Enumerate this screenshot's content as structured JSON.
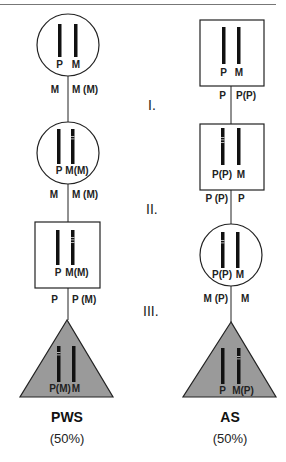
{
  "generations": [
    {
      "roman": "I."
    },
    {
      "roman": "II."
    },
    {
      "roman": "III."
    }
  ],
  "left_pedigree": {
    "individuals": [
      {
        "shape": "circle",
        "chromosome_labels": [
          "P",
          "M"
        ],
        "transmission_labels": [
          "M",
          "M (M)"
        ]
      },
      {
        "shape": "circle",
        "chromosome_labels": [
          "P",
          "M(M)"
        ],
        "transmission_labels": [
          "M",
          "M (M)"
        ]
      },
      {
        "shape": "square",
        "chromosome_labels": [
          "P",
          "M(M)"
        ],
        "transmission_labels": [
          "P",
          "P (M)"
        ]
      },
      {
        "shape": "triangle",
        "affected": true,
        "chromosome_labels": [
          "P(M)",
          "M"
        ]
      }
    ],
    "syndrome": "PWS",
    "risk": "(50%)"
  },
  "right_pedigree": {
    "individuals": [
      {
        "shape": "square",
        "chromosome_labels": [
          "P",
          "M"
        ],
        "transmission_labels": [
          "P",
          "P(P)"
        ]
      },
      {
        "shape": "square",
        "chromosome_labels": [
          "P(P)",
          "M"
        ],
        "transmission_labels": [
          "P (P)",
          "P"
        ]
      },
      {
        "shape": "circle",
        "chromosome_labels": [
          "P(P)",
          "M"
        ],
        "transmission_labels": [
          "M (P)",
          "M"
        ]
      },
      {
        "shape": "triangle",
        "affected": true,
        "chromosome_labels": [
          "P",
          "M(P)"
        ]
      }
    ],
    "syndrome": "AS",
    "risk": "(50%)"
  },
  "colors": {
    "affected_fill": "#9a9a9a",
    "outline": "#222222",
    "chromosome": "#111111"
  }
}
